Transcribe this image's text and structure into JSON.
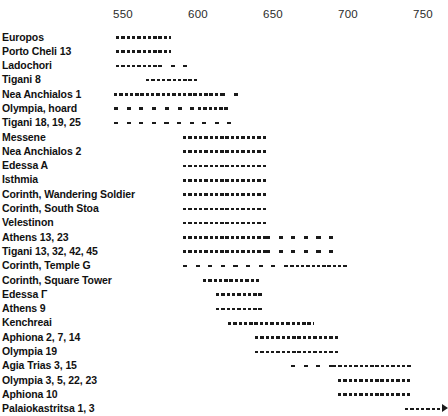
{
  "chart_data": {
    "type": "bar",
    "subtype": "gantt-range-chart",
    "title": "",
    "xlabel": "",
    "ylabel": "",
    "xlim": [
      537,
      770
    ],
    "axis_position": "top",
    "grid": false,
    "legend": null,
    "tick_labels": [
      "550",
      "600",
      "650",
      "700",
      "750"
    ],
    "tick_values": [
      550,
      600,
      650,
      700,
      750
    ],
    "categories": [
      "Europos",
      "Porto Cheli 13",
      "Ladochori",
      "Tigani 8",
      "Nea Anchialos 1",
      "Olympia, hoard",
      "Tigani 18, 19, 25",
      "Messene",
      "Nea Anchialos 2",
      "Edessa A",
      "Isthmia",
      "Corinth, Wandering Soldier",
      "Corinth, South Stoa",
      "Velestinon",
      "Athens 13, 23",
      "Tigani 13, 32, 42, 45",
      "Corinth, Temple G",
      "Corinth, Square Tower",
      "Edessa Γ",
      "Athens 9",
      "Kenchreai",
      "Aphiona 2, 7, 14",
      "Olympia 19",
      "Agia Trias 3, 15",
      "Olympia 3, 5, 22, 23",
      "Aphiona 10",
      "Palaiokastritsa 1, 3"
    ],
    "bars": [
      {
        "label": "Europos",
        "segments": [
          {
            "start": 545,
            "end": 582,
            "density": "dense"
          }
        ],
        "open_ended": false
      },
      {
        "label": "Porto Cheli 13",
        "segments": [
          {
            "start": 545,
            "end": 582,
            "density": "dense"
          }
        ],
        "open_ended": false
      },
      {
        "label": "Ladochori",
        "segments": [
          {
            "start": 545,
            "end": 573,
            "density": "dense"
          },
          {
            "start": 573,
            "end": 594,
            "density": "sparse"
          }
        ],
        "open_ended": false
      },
      {
        "label": "Tigani 8",
        "segments": [
          {
            "start": 565,
            "end": 600,
            "density": "dense"
          }
        ],
        "open_ended": false
      },
      {
        "label": "Nea Anchialos 1",
        "segments": [
          {
            "start": 544,
            "end": 615,
            "density": "dense"
          },
          {
            "start": 615,
            "end": 627,
            "density": "sparse"
          }
        ],
        "open_ended": false
      },
      {
        "label": "Olympia, hoard",
        "segments": [
          {
            "start": 544,
            "end": 575,
            "density": "sparse"
          },
          {
            "start": 578,
            "end": 600,
            "density": "sparse"
          },
          {
            "start": 600,
            "end": 617,
            "density": "dense"
          },
          {
            "start": 617,
            "end": 625,
            "density": "sparse"
          }
        ],
        "open_ended": false
      },
      {
        "label": "Tigani 18, 19, 25",
        "segments": [
          {
            "start": 544,
            "end": 622,
            "density": "sparse"
          }
        ],
        "open_ended": false
      },
      {
        "label": "Messene",
        "segments": [
          {
            "start": 590,
            "end": 645,
            "density": "dense"
          }
        ],
        "open_ended": false
      },
      {
        "label": "Nea Anchialos 2",
        "segments": [
          {
            "start": 590,
            "end": 645,
            "density": "dense"
          }
        ],
        "open_ended": false
      },
      {
        "label": "Edessa A",
        "segments": [
          {
            "start": 590,
            "end": 645,
            "density": "dense"
          }
        ],
        "open_ended": false
      },
      {
        "label": "Isthmia",
        "segments": [
          {
            "start": 590,
            "end": 645,
            "density": "dense"
          }
        ],
        "open_ended": false
      },
      {
        "label": "Corinth, Wandering Soldier",
        "segments": [
          {
            "start": 590,
            "end": 645,
            "density": "dense"
          }
        ],
        "open_ended": false
      },
      {
        "label": "Corinth, South Stoa",
        "segments": [
          {
            "start": 590,
            "end": 645,
            "density": "dense"
          }
        ],
        "open_ended": false
      },
      {
        "label": "Velestinon",
        "segments": [
          {
            "start": 590,
            "end": 645,
            "density": "dense"
          }
        ],
        "open_ended": false
      },
      {
        "label": "Athens 13, 23",
        "segments": [
          {
            "start": 590,
            "end": 645,
            "density": "dense"
          },
          {
            "start": 645,
            "end": 695,
            "density": "sparse"
          }
        ],
        "open_ended": false
      },
      {
        "label": "Tigani 13, 32, 42, 45",
        "segments": [
          {
            "start": 590,
            "end": 645,
            "density": "dense"
          },
          {
            "start": 645,
            "end": 695,
            "density": "sparse"
          }
        ],
        "open_ended": false
      },
      {
        "label": "Corinth, Temple G",
        "segments": [
          {
            "start": 590,
            "end": 658,
            "density": "sparse"
          },
          {
            "start": 658,
            "end": 700,
            "density": "dense"
          }
        ],
        "open_ended": false
      },
      {
        "label": "Corinth, Square Tower",
        "segments": [
          {
            "start": 603,
            "end": 641,
            "density": "dense"
          }
        ],
        "open_ended": false
      },
      {
        "label": "Edessa Γ",
        "segments": [
          {
            "start": 612,
            "end": 644,
            "density": "dense"
          }
        ],
        "open_ended": false
      },
      {
        "label": "Athens 9",
        "segments": [
          {
            "start": 612,
            "end": 644,
            "density": "dense"
          }
        ],
        "open_ended": false
      },
      {
        "label": "Kenchreai",
        "segments": [
          {
            "start": 620,
            "end": 677,
            "density": "dense"
          }
        ],
        "open_ended": false
      },
      {
        "label": "Aphiona 2, 7, 14",
        "segments": [
          {
            "start": 638,
            "end": 694,
            "density": "dense"
          }
        ],
        "open_ended": false
      },
      {
        "label": "Olympia 19",
        "segments": [
          {
            "start": 638,
            "end": 694,
            "density": "dense"
          }
        ],
        "open_ended": false
      },
      {
        "label": "Agia Trias 3, 15",
        "segments": [
          {
            "start": 662,
            "end": 690,
            "density": "sparse"
          },
          {
            "start": 690,
            "end": 742,
            "density": "dense"
          }
        ],
        "open_ended": false
      },
      {
        "label": "Olympia 3, 5, 22, 23",
        "segments": [
          {
            "start": 693,
            "end": 741,
            "density": "dense"
          }
        ],
        "open_ended": false
      },
      {
        "label": "Aphiona 10",
        "segments": [
          {
            "start": 693,
            "end": 741,
            "density": "dense"
          }
        ],
        "open_ended": false
      },
      {
        "label": "Palaiokastritsa 1, 3",
        "segments": [
          {
            "start": 738,
            "end": 762,
            "density": "dense"
          }
        ],
        "open_ended": true
      }
    ]
  }
}
